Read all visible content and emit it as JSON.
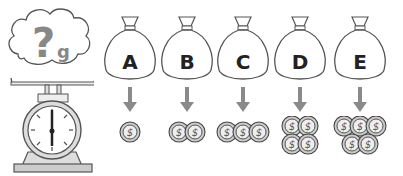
{
  "scale": {
    "question_mark": "?",
    "unit": "g"
  },
  "bags": [
    {
      "label": "A",
      "coins": 1
    },
    {
      "label": "B",
      "coins": 2
    },
    {
      "label": "C",
      "coins": 3
    },
    {
      "label": "D",
      "coins": 4
    },
    {
      "label": "E",
      "coins": 5
    }
  ],
  "colors": {
    "outline": "#444444",
    "arrow": "#8a8a8a",
    "question": "#888888"
  }
}
